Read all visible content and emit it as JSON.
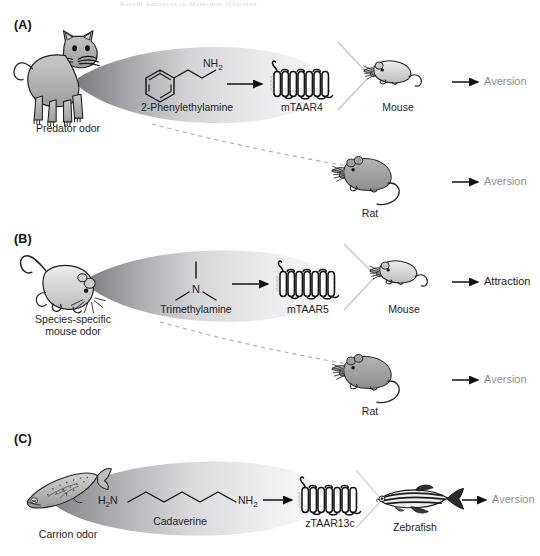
{
  "figure": {
    "running_header": "Recent Advances in Molecular Olfaction",
    "panels": [
      {
        "id": "A",
        "label": "(A)",
        "source_label": "Predator odor",
        "source_icon": "cat-illustration",
        "ligand_name": "2-Phenylethylamine",
        "ligand_structure": "phenyl-ethyl-amine",
        "ligand_group_label": "NH",
        "ligand_group_sub": "2",
        "receptor_label": "mTAAR4",
        "receptor_icon": "gpcr-seven-transmembrane",
        "responders": [
          {
            "animal": "Mouse",
            "animal_icon": "mouse-illustration",
            "outcome": "Aversion",
            "outcome_color": "#8e8e96",
            "outcome_tone": "grey"
          },
          {
            "animal": "Rat",
            "animal_icon": "rat-illustration",
            "outcome": "Aversion",
            "outcome_color": "#8e8e96",
            "outcome_tone": "grey"
          }
        ]
      },
      {
        "id": "B",
        "label": "(B)",
        "source_label": "Species-specific",
        "source_label_line2": "mouse odor",
        "source_icon": "mouse-illustration",
        "ligand_name": "Trimethylamine",
        "ligand_structure": "trimethylamine-nitrogen",
        "ligand_atom_label": "N",
        "receptor_label": "mTAAR5",
        "receptor_icon": "gpcr-seven-transmembrane",
        "responders": [
          {
            "animal": "Mouse",
            "animal_icon": "mouse-illustration",
            "outcome": "Attraction",
            "outcome_color": "#1a1a1a",
            "outcome_tone": "dark"
          },
          {
            "animal": "Rat",
            "animal_icon": "rat-illustration",
            "outcome": "Aversion",
            "outcome_color": "#8e8e96",
            "outcome_tone": "grey"
          }
        ]
      },
      {
        "id": "C",
        "label": "(C)",
        "source_label": "Carrion odor",
        "source_icon": "dead-fish-illustration",
        "ligand_name": "Cadaverine",
        "ligand_structure": "pentane-1-5-diamine",
        "ligand_left_label": "H",
        "ligand_left_sub": "2",
        "ligand_left_label2": "N",
        "ligand_right_label": "NH",
        "ligand_right_sub": "2",
        "receptor_label": "zTAAR13c",
        "receptor_icon": "gpcr-seven-transmembrane",
        "responders": [
          {
            "animal": "Zebrafish",
            "animal_icon": "zebrafish-illustration",
            "outcome": "Aversion",
            "outcome_color": "#8e8e96",
            "outcome_tone": "grey"
          }
        ]
      }
    ],
    "colors": {
      "ink": "#1a1a1a",
      "muted_text": "#8e8e96",
      "plume_dark": "#6e6e74",
      "plume_light": "#f2f2f4",
      "animal_fill": "#a8a8a8",
      "animal_fill_light": "#d9d9d9",
      "guide_line": "#b9b9bf"
    }
  }
}
